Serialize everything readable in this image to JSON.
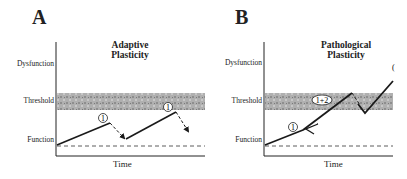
{
  "panels": [
    {
      "letter": "A",
      "title_line1": "Adaptive",
      "title_line2": "Plasticity",
      "y_labels": {
        "dysfunction": "Dysfunction",
        "threshold": "Threshold",
        "function": "Function"
      },
      "x_label": "Time",
      "markers": [
        "1",
        "1"
      ]
    },
    {
      "letter": "B",
      "title_line1": "Pathological",
      "title_line2": "Plasticity",
      "y_labels": {
        "dysfunction": "Dysfunction",
        "threshold": "Threshold",
        "function": "Function"
      },
      "x_label": "Time",
      "markers": [
        "1",
        "1+2"
      ],
      "edge_glyph": "("
    }
  ],
  "colors": {
    "band": "#a8a8a8",
    "line": "#1a1a1a",
    "background": "#ffffff"
  }
}
